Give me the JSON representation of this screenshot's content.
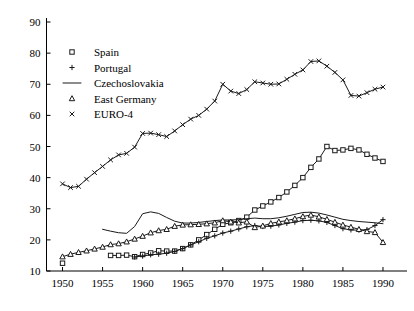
{
  "chart_data": {
    "type": "line",
    "title": "",
    "xlabel": "",
    "ylabel": "",
    "xlim": [
      1948,
      1992
    ],
    "ylim": [
      10,
      90
    ],
    "grid": false,
    "legend_position": "top-left",
    "x_ticks": [
      1950,
      1955,
      1960,
      1965,
      1970,
      1975,
      1980,
      1985,
      1990
    ],
    "y_ticks": [
      10,
      20,
      30,
      40,
      50,
      60,
      70,
      80,
      90
    ],
    "series": [
      {
        "name": "Spain",
        "marker": "square",
        "x": [
          1950,
          1956,
          1957,
          1958,
          1959,
          1960,
          1961,
          1962,
          1963,
          1964,
          1965,
          1966,
          1967,
          1968,
          1969,
          1970,
          1971,
          1972,
          1973,
          1974,
          1975,
          1976,
          1977,
          1978,
          1979,
          1980,
          1981,
          1982,
          1983,
          1984,
          1985,
          1986,
          1987,
          1988,
          1989,
          1990
        ],
        "values": [
          12.5,
          15.0,
          15.0,
          15.1,
          14.6,
          15.3,
          15.8,
          16.5,
          16.4,
          16.4,
          17.2,
          18.4,
          20.0,
          21.7,
          23.4,
          25.0,
          25.5,
          26.2,
          27.3,
          29.6,
          30.9,
          32.2,
          33.6,
          35.4,
          37.5,
          40.0,
          43.3,
          46.0,
          50.0,
          48.7,
          48.9,
          49.4,
          48.9,
          47.5,
          46.3,
          45.2
        ]
      },
      {
        "name": "Portugal",
        "marker": "plus",
        "x": [
          1959,
          1960,
          1961,
          1962,
          1963,
          1964,
          1965,
          1966,
          1967,
          1968,
          1969,
          1970,
          1971,
          1972,
          1973,
          1974,
          1975,
          1976,
          1977,
          1978,
          1979,
          1980,
          1981,
          1982,
          1983,
          1984,
          1985,
          1986,
          1987,
          1988,
          1989,
          1990
        ],
        "values": [
          14.5,
          14.8,
          15.2,
          15.4,
          15.7,
          16.3,
          17.2,
          18.4,
          19.4,
          20.5,
          21.3,
          22.2,
          22.8,
          23.5,
          24.2,
          24.6,
          24.3,
          24.4,
          24.8,
          25.3,
          25.7,
          26.2,
          26.3,
          26.1,
          25.6,
          24.6,
          23.6,
          23.2,
          23.1,
          23.3,
          24.6,
          26.5
        ]
      },
      {
        "name": "Czechoslovakia",
        "marker": "none",
        "x": [
          1955,
          1956,
          1957,
          1958,
          1959,
          1960,
          1961,
          1962,
          1963,
          1964,
          1965,
          1966,
          1967,
          1968,
          1969,
          1970,
          1971,
          1972,
          1973,
          1974,
          1975,
          1976,
          1977,
          1978,
          1979,
          1980,
          1981,
          1982,
          1983,
          1984,
          1985,
          1986,
          1987,
          1988,
          1989,
          1990
        ],
        "values": [
          23.4,
          22.8,
          22.3,
          22.1,
          24.3,
          28.4,
          29.0,
          28.5,
          27.2,
          26.0,
          25.4,
          25.4,
          25.6,
          25.9,
          26.2,
          26.4,
          26.4,
          26.5,
          26.8,
          27.0,
          26.8,
          26.8,
          27.1,
          27.6,
          28.2,
          28.8,
          28.9,
          28.6,
          28.0,
          27.3,
          26.6,
          26.2,
          25.9,
          25.7,
          25.5,
          25.2
        ]
      },
      {
        "name": "East Germany",
        "marker": "triangle",
        "x": [
          1950,
          1951,
          1952,
          1953,
          1954,
          1955,
          1956,
          1957,
          1958,
          1959,
          1960,
          1961,
          1962,
          1963,
          1964,
          1965,
          1966,
          1967,
          1968,
          1969,
          1970,
          1971,
          1972,
          1973,
          1974,
          1975,
          1976,
          1977,
          1978,
          1979,
          1980,
          1981,
          1982,
          1983,
          1984,
          1985,
          1986,
          1987,
          1988,
          1989,
          1990
        ],
        "values": [
          14.6,
          15.4,
          16.0,
          16.5,
          17.1,
          17.7,
          18.5,
          18.8,
          19.4,
          20.3,
          21.2,
          22.3,
          23.0,
          23.4,
          24.4,
          24.8,
          24.9,
          25.0,
          25.2,
          25.5,
          26.2,
          25.8,
          25.5,
          25.8,
          24.0,
          24.5,
          25.3,
          25.8,
          26.2,
          26.8,
          27.5,
          28.0,
          27.4,
          26.6,
          25.7,
          24.8,
          24.1,
          23.4,
          22.7,
          22.4,
          19.2
        ]
      },
      {
        "name": "EURO-4",
        "marker": "cross",
        "x": [
          1950,
          1951,
          1952,
          1953,
          1954,
          1955,
          1956,
          1957,
          1958,
          1959,
          1960,
          1961,
          1962,
          1963,
          1964,
          1965,
          1966,
          1967,
          1968,
          1969,
          1970,
          1971,
          1972,
          1973,
          1974,
          1975,
          1976,
          1977,
          1978,
          1979,
          1980,
          1981,
          1982,
          1983,
          1984,
          1985,
          1986,
          1987,
          1988,
          1989,
          1990
        ],
        "values": [
          38.0,
          36.8,
          37.2,
          39.5,
          41.6,
          43.6,
          45.7,
          47.3,
          47.8,
          49.8,
          54.2,
          54.3,
          53.8,
          53.2,
          55.0,
          57.0,
          58.8,
          60.0,
          62.0,
          64.6,
          70.0,
          67.8,
          67.0,
          68.3,
          70.8,
          70.4,
          70.0,
          70.1,
          71.6,
          73.2,
          74.6,
          77.3,
          77.5,
          75.8,
          73.8,
          71.4,
          66.4,
          66.2,
          67.3,
          68.4,
          69.1
        ]
      }
    ],
    "legend": [
      {
        "label": "Spain",
        "marker": "square"
      },
      {
        "label": "Portugal",
        "marker": "plus"
      },
      {
        "label": "Czechoslovakia",
        "marker": "line"
      },
      {
        "label": "East Germany",
        "marker": "triangle"
      },
      {
        "label": "EURO-4",
        "marker": "cross"
      }
    ]
  }
}
